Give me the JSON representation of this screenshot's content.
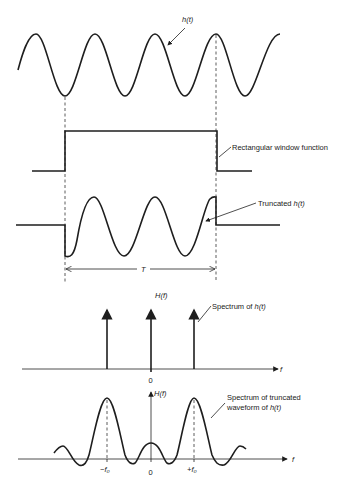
{
  "figure": {
    "panel_time_signal": {
      "label": "h(t)"
    },
    "panel_window": {
      "label": "Rectangular window function"
    },
    "panel_truncated": {
      "label_prefix": "Truncated ",
      "label_func": "h(t)",
      "duration_label": "T"
    },
    "panel_spectrum": {
      "y_label": "H(f)",
      "x_label": "f",
      "origin_label": "0",
      "annotation_prefix": "Spectrum of ",
      "annotation_func": "h(t)"
    },
    "panel_truncated_spectrum": {
      "y_label": "H(f)",
      "x_label": "f",
      "origin_label": "0",
      "neg_freq_label": "−f₀",
      "pos_freq_label": "+f₀",
      "annotation_line1": "Spectrum of truncated",
      "annotation_line2_prefix": "waveform of ",
      "annotation_line2_func": "h(t)"
    }
  }
}
